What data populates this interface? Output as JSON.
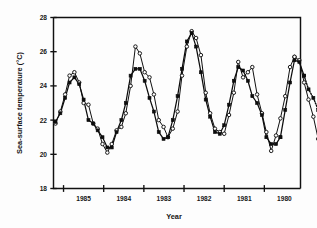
{
  "figure": {
    "background_color": "#fdfdfd",
    "ink_color": "#111111"
  },
  "chart_data": {
    "type": "line",
    "title": "",
    "xlabel": "Year",
    "ylabel": "Sea-surface temperature (°C)",
    "xlim": [
      1985.75,
      1979.6
    ],
    "ylim": [
      18,
      28
    ],
    "x_axis_reversed": true,
    "grid": false,
    "legend_position": "none",
    "y_ticks": [
      18,
      20,
      22,
      24,
      26,
      28
    ],
    "y_tick_labels": [
      "18",
      "20",
      "22",
      "24",
      "26",
      "28"
    ],
    "x_ticks": [
      1985.5,
      1984.5,
      1983.5,
      1982.5,
      1981.5,
      1980.5
    ],
    "x_tick_labels": [
      "",
      "",
      "",
      "",
      "",
      ""
    ],
    "x_label_positions": [
      1985.0,
      1984.0,
      1983.0,
      1982.0,
      1981.0,
      1980.0
    ],
    "x_labels": [
      "1985",
      "1984",
      "1983",
      "1982",
      "1981",
      "1980"
    ],
    "series": [
      {
        "name": "open-circles",
        "marker": "circle-open",
        "linestyle": "solid",
        "x": [
          1985.7,
          1985.58,
          1985.46,
          1985.35,
          1985.23,
          1985.11,
          1985.0,
          1984.88,
          1984.76,
          1984.65,
          1984.53,
          1984.41,
          1984.3,
          1984.18,
          1984.06,
          1983.95,
          1983.83,
          1983.71,
          1983.6,
          1983.48,
          1983.36,
          1983.25,
          1983.13,
          1983.01,
          1982.9,
          1982.78,
          1982.66,
          1982.55,
          1982.43,
          1982.31,
          1982.2,
          1982.08,
          1981.96,
          1981.85,
          1981.73,
          1981.61,
          1981.5,
          1981.38,
          1981.26,
          1981.15,
          1981.03,
          1980.91,
          1980.8,
          1980.68,
          1980.56,
          1980.45,
          1980.33,
          1980.21,
          1980.1,
          1979.98,
          1979.86,
          1979.75
        ],
        "y": [
          21.8,
          22.5,
          23.5,
          24.6,
          24.8,
          24.2,
          23.0,
          22.9,
          21.8,
          21.5,
          20.6,
          20.1,
          20.6,
          21.4,
          21.6,
          22.4,
          24.0,
          26.3,
          25.9,
          24.8,
          24.5,
          23.5,
          22.0,
          21.6,
          21.0,
          21.5,
          22.5,
          24.6,
          26.3,
          27.2,
          26.8,
          25.8,
          23.6,
          22.4,
          21.5,
          21.3,
          21.2,
          22.3,
          23.6,
          25.4,
          24.5,
          24.8,
          25.1,
          23.5,
          22.4,
          21.3,
          20.2,
          21.1,
          22.1,
          23.4,
          25.1,
          25.7
        ]
      },
      {
        "name": "open-circles-part2",
        "marker": "circle-open",
        "linestyle": "solid",
        "x": [
          1979.75,
          1979.63,
          1979.51,
          1979.4,
          1979.28,
          1979.16,
          1979.05,
          1978.93,
          1978.81,
          1978.7,
          1978.58,
          1978.46,
          1978.35,
          1978.23
        ],
        "y": [
          25.7,
          25.5,
          24.2,
          23.2,
          22.2,
          20.9,
          19.7,
          20.7,
          21.7,
          23.4,
          24.5,
          25.2,
          25.6,
          25.4
        ]
      },
      {
        "name": "filled-squares",
        "marker": "square-filled",
        "linestyle": "solid",
        "x": [
          1985.7,
          1985.58,
          1985.46,
          1985.35,
          1985.23,
          1985.11,
          1985.0,
          1984.88,
          1984.76,
          1984.65,
          1984.53,
          1984.41,
          1984.3,
          1984.18,
          1984.06,
          1983.95,
          1983.83,
          1983.71,
          1983.6,
          1983.48,
          1983.36,
          1983.25,
          1983.13,
          1983.01,
          1982.9,
          1982.78,
          1982.66,
          1982.55,
          1982.43,
          1982.31,
          1982.2,
          1982.08,
          1981.96,
          1981.85,
          1981.73,
          1981.61,
          1981.5,
          1981.38,
          1981.26,
          1981.15,
          1981.03,
          1980.91,
          1980.8,
          1980.68,
          1980.56,
          1980.45,
          1980.33,
          1980.21,
          1980.1
        ],
        "y": [
          21.9,
          22.4,
          23.3,
          24.2,
          24.5,
          24.1,
          23.2,
          22.0,
          21.8,
          21.4,
          21.0,
          20.4,
          20.4,
          21.3,
          22.0,
          23.0,
          24.6,
          25.0,
          25.0,
          24.3,
          23.3,
          22.5,
          21.3,
          20.9,
          21.0,
          22.0,
          23.4,
          25.0,
          26.6,
          27.1,
          26.3,
          24.8,
          23.2,
          22.2,
          21.3,
          21.2,
          21.7,
          22.9,
          24.3,
          25.1,
          24.9,
          24.3,
          23.4,
          23.0,
          22.3,
          21.0,
          20.6,
          20.6,
          21.0
        ]
      },
      {
        "name": "filled-squares-part2",
        "marker": "square-filled",
        "linestyle": "solid",
        "x": [
          1980.1,
          1979.98,
          1979.86,
          1979.75,
          1979.63,
          1979.51
        ],
        "y": [
          21.0,
          22.6,
          24.2,
          25.5,
          25.4,
          24.6
        ]
      },
      {
        "name": "filled-squares-dotted-tail",
        "marker": "square-filled",
        "linestyle": "dotted",
        "x": [
          1979.51,
          1979.4,
          1979.28,
          1979.16,
          1979.05,
          1978.93
        ],
        "y": [
          24.6,
          23.8,
          23.3,
          22.6,
          21.0,
          20.7
        ]
      }
    ]
  },
  "annotations": {
    "axis_frame": "open-top-right-rectangle"
  }
}
